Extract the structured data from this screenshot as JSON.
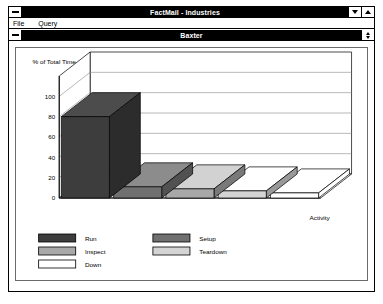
{
  "app_window": {
    "titlebar": {
      "title": "FactMail - Industries",
      "system_menu_icon": "minimize-box-icon",
      "minimize_icon": "arrow-down-icon",
      "maximize_icon": "arrow-up-icon"
    },
    "menubar": {
      "items": [
        {
          "label": "File"
        },
        {
          "label": "Query"
        }
      ]
    }
  },
  "child_window": {
    "titlebar": {
      "title": "Baxter",
      "system_menu_icon": "minimize-box-icon",
      "restore_icon": "restore-updown-icon"
    }
  },
  "colors": {
    "titlebar_bg": "#000000",
    "titlebar_fg": "#ffffff",
    "panel_border": "#6b6b6b",
    "grid_line": "#8a8a8a",
    "axis_line": "#000000",
    "run": "#3d3d3d",
    "setup": "#707070",
    "inspect": "#a8a8a8",
    "teardown": "#d4d4d4",
    "down": "#ffffff"
  },
  "chart_data": {
    "type": "bar",
    "title": "",
    "subtitle": "",
    "ylabel": "% of Total Time",
    "xlabel": "Activity",
    "categories": [
      "Run",
      "Setup",
      "Inspect",
      "Teardown",
      "Down"
    ],
    "values": [
      80,
      11,
      9,
      7,
      5
    ],
    "ylim": [
      0,
      120
    ],
    "yticks": [
      0,
      20,
      40,
      60,
      80,
      100
    ],
    "ytick_labels": [
      "0",
      "20",
      "40",
      "60",
      "80",
      "100"
    ],
    "grid": true,
    "three_d": true,
    "legend_position": "bottom-left",
    "legend": [
      {
        "label": "Run",
        "color": "#3d3d3d"
      },
      {
        "label": "Setup",
        "color": "#707070"
      },
      {
        "label": "Inspect",
        "color": "#a8a8a8"
      },
      {
        "label": "Teardown",
        "color": "#d4d4d4"
      },
      {
        "label": "Down",
        "color": "#ffffff"
      }
    ]
  }
}
